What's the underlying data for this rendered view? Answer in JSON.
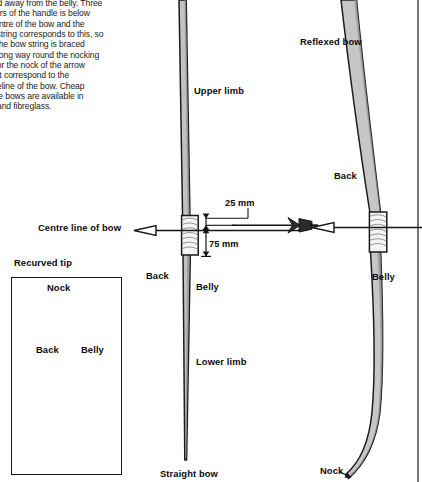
{
  "page": {
    "width": 422,
    "height": 482,
    "background": "#ffffff",
    "ink": "#141414"
  },
  "body_text": {
    "name": "bow-handle-paragraph",
    "content": "red away from the belly. Three\nrters of the handle is below\ncentre of the bow and the\nv string corresponds to this, so\nif the bow string is braced\nwrong way round the nocking\nt for the nock of the arrow\nnot correspond to the\ncreline of the bow. Cheap\ntice bows are available in\nn and fibreglass."
  },
  "diagram": {
    "title_labels": {
      "straight_bow": "Straight bow",
      "reflexed_bow": "Reflexed bow"
    },
    "centre_bow": {
      "upper_limb": "Upper limb",
      "lower_limb": "Lower limb",
      "back": "Back",
      "belly": "Belly",
      "centre_line": "Centre line of bow"
    },
    "reflexed_bow": {
      "back": "Back",
      "belly": "Belly",
      "nock": "Nock"
    },
    "dimensions": [
      {
        "label": "25 mm",
        "name": "dimension-25mm"
      },
      {
        "label": "75 mm",
        "name": "dimension-75mm"
      }
    ]
  },
  "inset": {
    "caption": "Recurved tip",
    "nock": "Nock",
    "back": "Back",
    "belly": "Belly"
  },
  "colors": {
    "limb_fill": "#bcbcbc",
    "limb_fill_light": "#d8d8d8",
    "grip_fill": "#f2f2f2",
    "outline": "#1a1a1a",
    "string": "#2b2b2b"
  }
}
